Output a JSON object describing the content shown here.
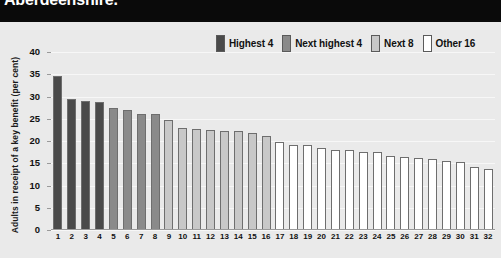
{
  "header": {
    "title": "Aberdeenshire."
  },
  "legend": {
    "items": [
      {
        "label": "Highest 4",
        "color": "#4a4a4a"
      },
      {
        "label": "Next highest 4",
        "color": "#8a8a8a"
      },
      {
        "label": "Next 8",
        "color": "#c8c8c8"
      },
      {
        "label": "Other 16",
        "color": "#ffffff"
      }
    ]
  },
  "source": {
    "text": "Source: Client Group Analysis, Quarterly Bulletin on Population of Working Age, DWP 2002 (2000/01 data)"
  },
  "chart_data": {
    "type": "bar",
    "title": "Aberdeenshire.",
    "xlabel": "",
    "ylabel": "Adults in receipt of a key benefit (per cent)",
    "ylim": [
      0,
      40
    ],
    "yticks": [
      0,
      5,
      10,
      15,
      20,
      25,
      30,
      35,
      40
    ],
    "grid": true,
    "legend_position": "top-right",
    "categories": [
      "1",
      "2",
      "3",
      "4",
      "5",
      "6",
      "7",
      "8",
      "9",
      "10",
      "11",
      "12",
      "13",
      "14",
      "15",
      "16",
      "17",
      "18",
      "19",
      "20",
      "21",
      "22",
      "23",
      "24",
      "25",
      "26",
      "27",
      "28",
      "29",
      "30",
      "31",
      "32"
    ],
    "values": [
      34.7,
      29.4,
      29.0,
      28.7,
      27.5,
      27.0,
      26.0,
      26.0,
      24.8,
      23.0,
      22.6,
      22.5,
      22.3,
      22.2,
      21.8,
      21.2,
      19.7,
      19.2,
      19.0,
      18.4,
      18.0,
      17.9,
      17.6,
      17.5,
      16.6,
      16.3,
      16.2,
      16.0,
      15.5,
      15.2,
      14.2,
      13.7
    ],
    "group_colors": [
      "#4a4a4a",
      "#4a4a4a",
      "#4a4a4a",
      "#4a4a4a",
      "#8a8a8a",
      "#8a8a8a",
      "#8a8a8a",
      "#8a8a8a",
      "#c8c8c8",
      "#c8c8c8",
      "#c8c8c8",
      "#c8c8c8",
      "#c8c8c8",
      "#c8c8c8",
      "#c8c8c8",
      "#c8c8c8",
      "#ffffff",
      "#ffffff",
      "#ffffff",
      "#ffffff",
      "#ffffff",
      "#ffffff",
      "#ffffff",
      "#ffffff",
      "#ffffff",
      "#ffffff",
      "#ffffff",
      "#ffffff",
      "#ffffff",
      "#ffffff",
      "#ffffff",
      "#ffffff"
    ],
    "group_names": [
      "Highest 4",
      "Next highest 4",
      "Next 8",
      "Other 16"
    ]
  }
}
